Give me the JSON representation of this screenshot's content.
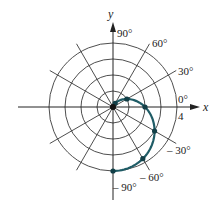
{
  "figure": {
    "type": "polar-plot",
    "equation_hint": "r = 2 - 2 sin(theta)",
    "axis_labels": {
      "x": "x",
      "y": "y"
    },
    "radius_tick_label": "4",
    "angle_labels": [
      {
        "text": "90°",
        "angle": 90
      },
      {
        "text": "60°",
        "angle": 60
      },
      {
        "text": "30°",
        "angle": 30
      },
      {
        "text": "0°",
        "angle": 0
      },
      {
        "text": "– 30°",
        "angle": -30
      },
      {
        "text": "– 60°",
        "angle": -60
      },
      {
        "text": "– 90°",
        "angle": -90
      }
    ],
    "rings": [
      1,
      2,
      3,
      4
    ],
    "radial_line_step_deg": 30,
    "colors": {
      "grid": "#3a3a3a",
      "axis": "#222222",
      "curve": "#1f5c66",
      "points": "#123f47"
    }
  },
  "chart_data": {
    "type": "polar-line",
    "title": "",
    "xlabel": "x",
    "ylabel": "y",
    "r_range": [
      0,
      4
    ],
    "r_ticks": [
      1,
      2,
      3,
      4
    ],
    "theta_ticks_deg": [
      90,
      60,
      30,
      0,
      -30,
      -60,
      -90
    ],
    "series": [
      {
        "name": "curve",
        "points": [
          {
            "theta_deg": 90,
            "r": 0
          },
          {
            "theta_deg": 60,
            "r": 0.27
          },
          {
            "theta_deg": 30,
            "r": 1
          },
          {
            "theta_deg": 0,
            "r": 2
          },
          {
            "theta_deg": -30,
            "r": 3
          },
          {
            "theta_deg": -60,
            "r": 3.73
          },
          {
            "theta_deg": -90,
            "r": 4
          }
        ]
      }
    ]
  }
}
